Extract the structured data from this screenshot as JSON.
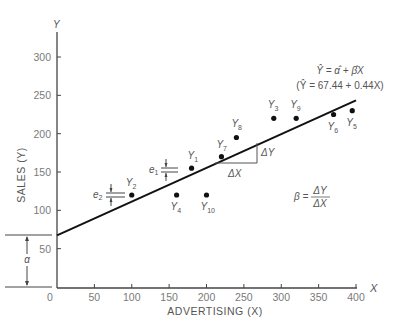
{
  "chart_data": {
    "type": "scatter",
    "title": "",
    "xlabel": "ADVERTISING (X)",
    "ylabel": "SALES (Y)",
    "x_axis_symbol": "X",
    "y_axis_symbol": "Y",
    "xlim": [
      0,
      400
    ],
    "ylim": [
      0,
      320
    ],
    "x_ticks": [
      0,
      50,
      100,
      150,
      200,
      250,
      300,
      350,
      400
    ],
    "y_ticks": [
      50,
      100,
      150,
      200,
      250,
      300
    ],
    "grid": false,
    "legend": null,
    "points": [
      {
        "label": "Y1",
        "x": 180,
        "y": 155
      },
      {
        "label": "Y2",
        "x": 100,
        "y": 120
      },
      {
        "label": "Y3",
        "x": 290,
        "y": 220
      },
      {
        "label": "Y4",
        "x": 160,
        "y": 120
      },
      {
        "label": "Y5",
        "x": 395,
        "y": 230
      },
      {
        "label": "Y6",
        "x": 370,
        "y": 225
      },
      {
        "label": "Y7",
        "x": 220,
        "y": 170
      },
      {
        "label": "Y8",
        "x": 240,
        "y": 195
      },
      {
        "label": "Y9",
        "x": 320,
        "y": 220
      },
      {
        "label": "Y10",
        "x": 200,
        "y": 120
      }
    ],
    "regression_line": {
      "intercept": 67.44,
      "slope": 0.44,
      "x_range": [
        0,
        400
      ],
      "equation_general": "Ŷ = α̂ + β̂X",
      "equation_fitted": "(Ŷ = 67.44 + 0.44X)"
    },
    "annotations": {
      "alpha_label": "α",
      "slope_formula_lhs": "β =",
      "slope_formula_num": "ΔY",
      "slope_formula_den": "ΔX",
      "delta_x_label": "ΔX",
      "delta_y_label": "ΔY",
      "residual_labels": [
        "e1",
        "e2"
      ]
    }
  },
  "labels": {
    "y_axis_title": "SALES (Y)",
    "x_axis_title": "ADVERTISING (X)",
    "x_symbol": "X",
    "y_symbol": "Y",
    "eq_general": "Ŷ = α̂ + β̂X",
    "eq_fitted": "(Ŷ = 67.44 + 0.44X)",
    "alpha": "α",
    "beta_lhs": "β =",
    "beta_num": "ΔY",
    "beta_den": "ΔX",
    "delta_x": "ΔX",
    "delta_y": "ΔY",
    "e1": "e",
    "e1_sub": "1",
    "e2": "e",
    "e2_sub": "2",
    "zero": "0"
  }
}
